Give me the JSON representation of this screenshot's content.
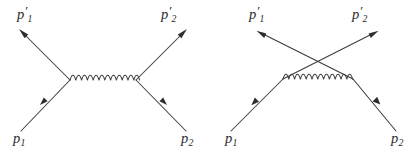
{
  "figure": {
    "type": "feynman-diagram-pair",
    "width": 420,
    "height": 153,
    "background_color": "#ffffff",
    "line_color": "#3c3c3c",
    "label_color": "#2b2b2b"
  },
  "diagrams": [
    {
      "id": "left-diagram",
      "name": "t-channel-diagram",
      "labels": {
        "incoming_left": {
          "base": "p",
          "sub": "1",
          "prime": ""
        },
        "incoming_right": {
          "base": "p",
          "sub": "2",
          "prime": ""
        },
        "outgoing_left": {
          "base": "p",
          "sub": "1",
          "prime": "′"
        },
        "outgoing_right": {
          "base": "p",
          "sub": "2",
          "prime": "′"
        }
      },
      "propagator": {
        "kind": "photon-wavy",
        "humps": 6,
        "orientation": "horizontal"
      },
      "vertices": 2,
      "lines_cross": false
    },
    {
      "id": "right-diagram",
      "name": "u-channel-exchange-diagram",
      "labels": {
        "incoming_left": {
          "base": "p",
          "sub": "1",
          "prime": ""
        },
        "incoming_right": {
          "base": "p",
          "sub": "2",
          "prime": ""
        },
        "outgoing_left": {
          "base": "p",
          "sub": "1",
          "prime": "′"
        },
        "outgoing_right": {
          "base": "p",
          "sub": "2",
          "prime": "′"
        }
      },
      "propagator": {
        "kind": "photon-wavy",
        "humps": 6,
        "orientation": "horizontal"
      },
      "vertices": 2,
      "lines_cross": true
    }
  ],
  "label_text": {
    "p1": "p",
    "p2": "p",
    "sub1": "1",
    "sub2": "2",
    "prime": "′"
  }
}
